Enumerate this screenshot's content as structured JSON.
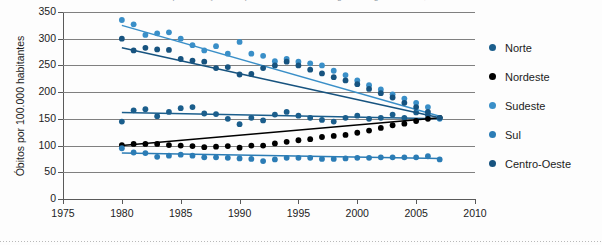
{
  "figure": {
    "title_clipped": "Mortalidade por doenças do aparelho circulatório segundo região - Brasil, 1980 a 2007"
  },
  "chart_data": {
    "type": "scatter",
    "title": "",
    "xlabel": "",
    "ylabel": "Óbitos por 100.000 habitantes",
    "xlim": [
      1975,
      2010
    ],
    "ylim": [
      0,
      350
    ],
    "xticks": [
      1975,
      1980,
      1985,
      1990,
      1995,
      2000,
      2005,
      2010
    ],
    "yticks": [
      0,
      50,
      100,
      150,
      200,
      250,
      300,
      350
    ],
    "grid": "horizontal",
    "legend_position": "right",
    "trendlines": true,
    "x": [
      1980,
      1981,
      1982,
      1983,
      1984,
      1985,
      1986,
      1987,
      1988,
      1989,
      1990,
      1991,
      1992,
      1993,
      1994,
      1995,
      1996,
      1997,
      1998,
      1999,
      2000,
      2001,
      2002,
      2003,
      2004,
      2005,
      2006,
      2007
    ],
    "series": [
      {
        "name": "Norte",
        "color": "#1b5e8c",
        "values": [
          145,
          166,
          168,
          155,
          163,
          170,
          172,
          160,
          159,
          150,
          140,
          152,
          147,
          158,
          163,
          156,
          152,
          148,
          145,
          152,
          156,
          150,
          152,
          158,
          152,
          162,
          157,
          152
        ],
        "trend": {
          "start": 162,
          "end": 150
        }
      },
      {
        "name": "Nordeste",
        "color": "#000000",
        "values": [
          101,
          103,
          103,
          103,
          101,
          100,
          99,
          97,
          98,
          99,
          96,
          100,
          100,
          104,
          107,
          110,
          112,
          116,
          118,
          120,
          124,
          128,
          133,
          138,
          141,
          146,
          150,
          152
        ],
        "trend": {
          "start": 100,
          "end": 152
        }
      },
      {
        "name": "Sudeste",
        "color": "#3a8fc8",
        "values": [
          335,
          327,
          307,
          310,
          312,
          300,
          288,
          278,
          286,
          272,
          294,
          272,
          268,
          258,
          262,
          257,
          254,
          250,
          240,
          232,
          222,
          213,
          205,
          196,
          188,
          180,
          172,
          150
        ],
        "trend": {
          "start": 325,
          "end": 155
        }
      },
      {
        "name": "Sul",
        "color": "#2b7cb5",
        "values": [
          95,
          87,
          86,
          79,
          81,
          83,
          81,
          78,
          78,
          77,
          76,
          75,
          71,
          74,
          77,
          77,
          77,
          75,
          75,
          76,
          77,
          77,
          78,
          78,
          78,
          78,
          80,
          74
        ],
        "trend": {
          "start": 86,
          "end": 76
        }
      },
      {
        "name": "Centro-Oeste",
        "color": "#17537f",
        "values": [
          300,
          278,
          283,
          280,
          279,
          262,
          259,
          257,
          245,
          247,
          233,
          234,
          245,
          250,
          257,
          250,
          242,
          235,
          228,
          222,
          215,
          206,
          198,
          190,
          180,
          172,
          163,
          152
        ],
        "trend": {
          "start": 283,
          "end": 152
        }
      }
    ]
  },
  "legend": {
    "items": [
      {
        "label": "Norte",
        "color": "#1b5e8c"
      },
      {
        "label": "Nordeste",
        "color": "#000000"
      },
      {
        "label": "Sudeste",
        "color": "#3a8fc8"
      },
      {
        "label": "Sul",
        "color": "#2b7cb5"
      },
      {
        "label": "Centro-Oeste",
        "color": "#17537f"
      }
    ]
  }
}
